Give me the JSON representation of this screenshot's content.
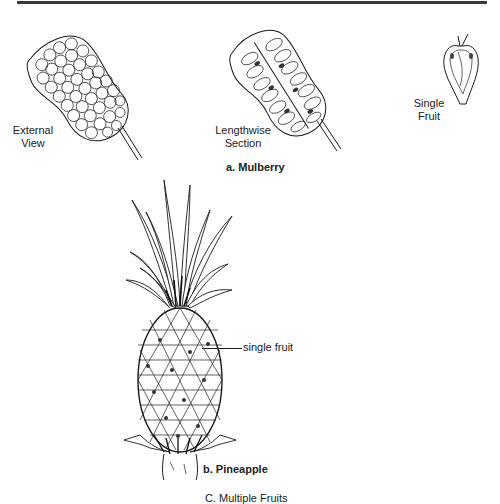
{
  "figure": {
    "part_a": {
      "caption": "a. Mulberry",
      "labels": {
        "external": [
          "External",
          "View"
        ],
        "section": [
          "Lengthwise",
          "Section"
        ],
        "single": [
          "Single",
          "Fruit"
        ]
      }
    },
    "part_b": {
      "caption": "b. Pineapple",
      "callout": "single fruit"
    },
    "figure_caption": "C. Multiple Fruits"
  }
}
